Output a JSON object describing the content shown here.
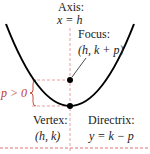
{
  "colors": {
    "curve": "#000000",
    "axis_dash": "#e8a0a0",
    "guide_dash": "#e07070",
    "brace": "#c0392b",
    "text": "#222222",
    "text_red": "#c0392b"
  },
  "labels": {
    "axis_title": "Axis:",
    "axis_eq": "x = h",
    "focus_title": "Focus:",
    "focus_coord": "(h, k + p)",
    "p_label": "p > 0",
    "vertex_title": "Vertex:",
    "vertex_coord": "(h, k)",
    "directrix_title": "Directrix:",
    "directrix_eq": "y = k − p"
  },
  "geometry": {
    "axis_x": 70,
    "focus_y": 80,
    "vertex_y": 106,
    "directrix_y": 148
  }
}
